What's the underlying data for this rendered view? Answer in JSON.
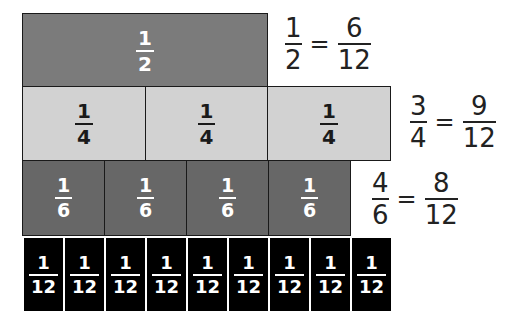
{
  "colors": {
    "half": "#7b7b7b",
    "quarter": "#d2d2d2",
    "sixth": "#676767",
    "twelfth": "#000000"
  },
  "rows": {
    "halves": {
      "cells": [
        {
          "num": "1",
          "den": "2"
        }
      ]
    },
    "quarters": {
      "cells": [
        {
          "num": "1",
          "den": "4"
        },
        {
          "num": "1",
          "den": "4"
        },
        {
          "num": "1",
          "den": "4"
        }
      ]
    },
    "sixths": {
      "cells": [
        {
          "num": "1",
          "den": "6"
        },
        {
          "num": "1",
          "den": "6"
        },
        {
          "num": "1",
          "den": "6"
        },
        {
          "num": "1",
          "den": "6"
        }
      ]
    },
    "twelfths": {
      "cells": [
        {
          "num": "1",
          "den": "12"
        },
        {
          "num": "1",
          "den": "12"
        },
        {
          "num": "1",
          "den": "12"
        },
        {
          "num": "1",
          "den": "12"
        },
        {
          "num": "1",
          "den": "12"
        },
        {
          "num": "1",
          "den": "12"
        },
        {
          "num": "1",
          "den": "12"
        },
        {
          "num": "1",
          "den": "12"
        },
        {
          "num": "1",
          "den": "12"
        }
      ]
    }
  },
  "equations": [
    {
      "left": {
        "num": "1",
        "den": "2"
      },
      "op": "=",
      "right": {
        "num": "6",
        "den": "12"
      }
    },
    {
      "left": {
        "num": "3",
        "den": "4"
      },
      "op": "=",
      "right": {
        "num": "9",
        "den": "12"
      }
    },
    {
      "left": {
        "num": "4",
        "den": "6"
      },
      "op": "=",
      "right": {
        "num": "8",
        "den": "12"
      }
    }
  ]
}
